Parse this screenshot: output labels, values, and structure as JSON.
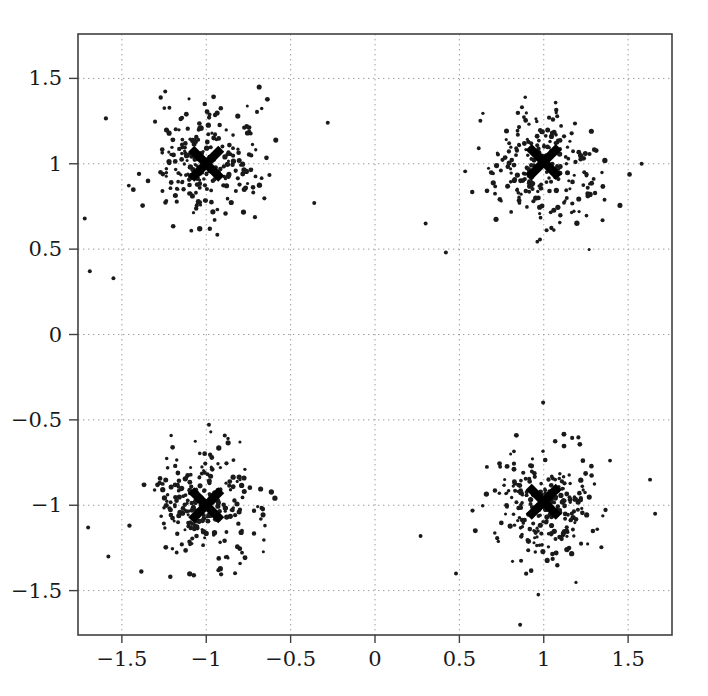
{
  "chart_data": {
    "type": "scatter",
    "title": "",
    "xlabel": "",
    "ylabel": "",
    "xlim": [
      -1.76,
      1.76
    ],
    "ylim": [
      -1.76,
      1.76
    ],
    "grid": true,
    "grid_style": "dotted",
    "legend": "none",
    "xticks": [
      -1.5,
      -1,
      -0.5,
      0,
      0.5,
      1,
      1.5
    ],
    "yticks": [
      -1.5,
      -1,
      -0.5,
      0,
      0.5,
      1,
      1.5
    ],
    "xticklabels": [
      "−1.5",
      "−1",
      "−0.5",
      "0",
      "0.5",
      "1",
      "1.5"
    ],
    "yticklabels": [
      "−1.5",
      "−1",
      "−0.5",
      "0",
      "0.5",
      "1",
      "1.5"
    ],
    "point_color": "#1a1a1a",
    "point_size": 2.1,
    "marker_color": "#000000",
    "marker_symbol": "x",
    "marker_size": 30,
    "series": [
      {
        "name": "cluster-top-left",
        "center": [
          -1.0,
          1.0
        ],
        "spread": 0.17,
        "n_points": 250
      },
      {
        "name": "cluster-top-right",
        "center": [
          1.0,
          1.0
        ],
        "spread": 0.17,
        "n_points": 250
      },
      {
        "name": "cluster-bottom-left",
        "center": [
          -1.0,
          -1.0
        ],
        "spread": 0.17,
        "n_points": 250
      },
      {
        "name": "cluster-bottom-right",
        "center": [
          1.0,
          -1.0
        ],
        "spread": 0.17,
        "n_points": 250
      }
    ],
    "centroids": [
      {
        "name": "centroid-top-left",
        "x": -1.0,
        "y": 1.0
      },
      {
        "name": "centroid-top-right",
        "x": 1.0,
        "y": 1.01
      },
      {
        "name": "centroid-bottom-left",
        "x": -1.0,
        "y": -1.0
      },
      {
        "name": "centroid-bottom-right",
        "x": 1.0,
        "y": -0.98
      }
    ],
    "outliers": [
      {
        "x": -1.72,
        "y": 0.68
      },
      {
        "x": -1.69,
        "y": 0.37
      },
      {
        "x": -1.55,
        "y": 0.33
      },
      {
        "x": -1.7,
        "y": -1.13
      },
      {
        "x": -1.58,
        "y": -1.3
      },
      {
        "x": 0.27,
        "y": -1.18
      },
      {
        "x": 0.3,
        "y": 0.65
      },
      {
        "x": 0.42,
        "y": 0.48
      },
      {
        "x": 0.48,
        "y": -1.4
      },
      {
        "x": 0.86,
        "y": -1.7
      },
      {
        "x": 1.63,
        "y": -0.85
      },
      {
        "x": 1.66,
        "y": -1.05
      },
      {
        "x": 1.58,
        "y": 1.0
      },
      {
        "x": -0.28,
        "y": 1.24
      },
      {
        "x": -0.36,
        "y": 0.77
      }
    ]
  }
}
